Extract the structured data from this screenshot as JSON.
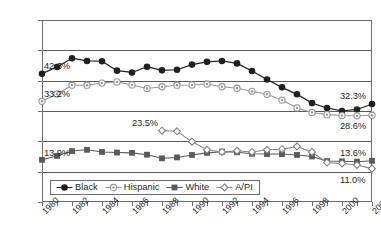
{
  "chart_data": {
    "type": "line",
    "title": "",
    "subtitle": "",
    "xlabel": "",
    "ylabel": "",
    "grid": true,
    "legend_position": "inside-bottom-left",
    "xlim": [
      1980,
      2002
    ],
    "ylim": [
      0,
      60
    ],
    "ytick_labels": [
      "0%",
      "10%",
      "20%",
      "30%",
      "40%",
      "50%",
      "60%"
    ],
    "ytick_values": [
      0,
      10,
      20,
      30,
      40,
      50,
      60
    ],
    "x": [
      1980,
      1981,
      1982,
      1983,
      1984,
      1985,
      1986,
      1987,
      1988,
      1989,
      1990,
      1991,
      1992,
      1993,
      1994,
      1995,
      1996,
      1997,
      1998,
      1999,
      2000,
      2001,
      2002
    ],
    "xtick_labels": [
      "1980",
      "1982",
      "1984",
      "1986",
      "1988",
      "1990",
      "1992",
      "1994",
      "1996",
      "1998",
      "2000",
      "2002"
    ],
    "xtick_label_values": [
      1980,
      1982,
      1984,
      1986,
      1988,
      1990,
      1992,
      1994,
      1996,
      1998,
      2000,
      2002
    ],
    "series": [
      {
        "name": "Black",
        "marker": "filled-circle",
        "color": "#231f20",
        "values": [
          42.3,
          44.5,
          47.4,
          46.5,
          46.4,
          43.3,
          42.7,
          44.6,
          43.4,
          43.6,
          45.3,
          46.2,
          46.5,
          45.7,
          43.2,
          40.4,
          37.8,
          35.5,
          32.6,
          31.0,
          30.0,
          30.5,
          32.3
        ]
      },
      {
        "name": "Hispanic",
        "marker": "ring-circle",
        "color": "#939598",
        "values": [
          33.2,
          35.6,
          38.5,
          38.5,
          39.2,
          39.6,
          38.6,
          37.4,
          38.0,
          38.5,
          38.6,
          38.9,
          38.0,
          37.5,
          36.5,
          35.5,
          33.6,
          31.0,
          29.5,
          28.8,
          28.5,
          28.4,
          28.6
        ]
      },
      {
        "name": "White",
        "marker": "filled-square",
        "color": "#58595b",
        "values": [
          13.9,
          15.2,
          16.8,
          17.2,
          16.5,
          16.3,
          16.2,
          15.6,
          14.4,
          14.7,
          15.5,
          16.2,
          16.6,
          16.4,
          15.9,
          15.8,
          15.8,
          15.5,
          15.0,
          13.5,
          13.4,
          13.3,
          13.6
        ]
      },
      {
        "name": "A/PI",
        "marker": "open-diamond",
        "color": "#808285",
        "values": [
          null,
          null,
          null,
          null,
          null,
          null,
          null,
          null,
          23.5,
          23.3,
          19.9,
          17.2,
          16.5,
          16.9,
          16.5,
          17.2,
          17.4,
          18.3,
          16.5,
          13.0,
          12.7,
          12.2,
          11.0
        ]
      }
    ],
    "annotations": [
      {
        "label": "42.3%",
        "series": "Black",
        "x": 1980,
        "y": 42.3
      },
      {
        "label": "33.2%",
        "series": "Hispanic",
        "x": 1980,
        "y": 33.2
      },
      {
        "label": "13.9%",
        "series": "White",
        "x": 1980,
        "y": 13.9
      },
      {
        "label": "23.5%",
        "series": "A/PI",
        "x": 1988,
        "y": 23.5
      },
      {
        "label": "32.3%",
        "series": "Black",
        "x": 2002,
        "y": 32.3
      },
      {
        "label": "28.6%",
        "series": "Hispanic",
        "x": 2002,
        "y": 28.6
      },
      {
        "label": "13.6%",
        "series": "White",
        "x": 2002,
        "y": 13.6
      },
      {
        "label": "11.0%",
        "series": "A/PI",
        "x": 2002,
        "y": 11.0
      }
    ]
  },
  "legend": {
    "items": [
      {
        "label": "Black",
        "marker": "filled-circle"
      },
      {
        "label": "Hispanic",
        "marker": "ring-circle"
      },
      {
        "label": "White",
        "marker": "filled-square"
      },
      {
        "label": "A/PI",
        "marker": "open-diamond"
      }
    ]
  },
  "colors": {
    "black_series": "#231f20",
    "hispanic_series": "#939598",
    "white_series": "#58595b",
    "api_series": "#808285",
    "axis": "#6d6e71",
    "gridline": "#58595b",
    "background": "#ffffff"
  }
}
